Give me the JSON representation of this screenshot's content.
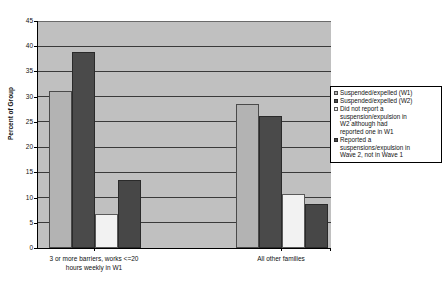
{
  "chart_data": {
    "type": "bar",
    "title": "",
    "xlabel": "",
    "ylabel": "Percent of Group",
    "ylim": [
      0,
      45
    ],
    "yticks": [
      0,
      5,
      10,
      15,
      20,
      25,
      30,
      35,
      40,
      45
    ],
    "grid": true,
    "legend_position": "right",
    "categories": [
      "3 or more barriers, works <=20 hours weekly in W1",
      "All other families"
    ],
    "category_lines": [
      [
        "3 or more barriers, works <=20",
        "hours weekly in W1"
      ],
      [
        "All other families"
      ]
    ],
    "series": [
      {
        "name": "Suspended/expelled (W1)",
        "color": "#b3b3b3",
        "values": [
          31.1,
          28.6
        ]
      },
      {
        "name": "Suspended/expelled (W2)",
        "color": "#4a4a4a",
        "values": [
          38.8,
          26.2
        ]
      },
      {
        "name": "Did not report a suspension/expulsion in W2 although had reported one in W1",
        "color": "#f2f2f2",
        "values": [
          6.7,
          10.8
        ]
      },
      {
        "name": "Reported a suspensions/expulsion in Wave 2, not in Wave 1",
        "color": "#474747",
        "values": [
          13.5,
          8.7
        ]
      }
    ],
    "legend_entries": [
      {
        "label_lines": [
          "Suspended/expelled (W1)"
        ]
      },
      {
        "label_lines": [
          "Suspended/expelled (W2)"
        ]
      },
      {
        "label_lines": [
          "Did not report a",
          "suspension/expulsion in",
          "W2 although had",
          "reported one in W1"
        ]
      },
      {
        "label_lines": [
          "Reported a",
          "suspensions/expulsion in",
          "Wave 2, not in Wave 1"
        ]
      }
    ],
    "plot_background": "#c0c0c0"
  }
}
